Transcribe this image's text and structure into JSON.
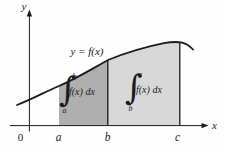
{
  "diagram": {
    "curve_label": "y = f(x)",
    "axes": {
      "x_label": "x",
      "y_label": "y",
      "origin_label": "0"
    },
    "x_ticks": [
      "a",
      "b",
      "c"
    ],
    "regions": [
      {
        "id": "a-to-b",
        "fill": "#afafaf",
        "integral": {
          "sign": "∫",
          "upper": "b",
          "lower": "a",
          "integrand": "f(x) dx"
        }
      },
      {
        "id": "b-to-c",
        "fill": "#d8d8d8",
        "integral": {
          "sign": "∫",
          "upper": "c",
          "lower": "b",
          "integrand": "f(x) dx"
        }
      }
    ],
    "colors": {
      "curve": "#1b1b1b",
      "axis": "#1b1b1b",
      "background": "#fefefe"
    }
  }
}
